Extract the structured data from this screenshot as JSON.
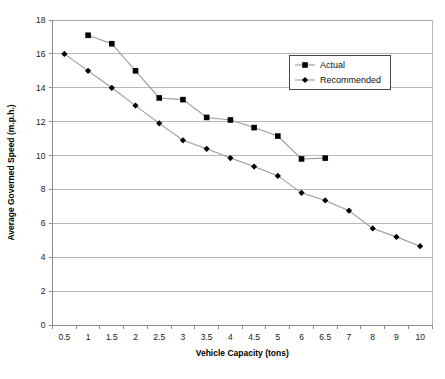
{
  "chart_data": {
    "type": "line",
    "title": "",
    "xlabel": "Vehicle Capacity (tons)",
    "ylabel": "Average Governed Speed (m.p.h.)",
    "categories": [
      "0.5",
      "1",
      "1.5",
      "2",
      "2.5",
      "3",
      "3.5",
      "4",
      "4.5",
      "5",
      "6",
      "6.5",
      "7",
      "8",
      "9",
      "10"
    ],
    "ylim": [
      0,
      18
    ],
    "yticks": [
      "0",
      "2",
      "4",
      "6",
      "8",
      "10",
      "12",
      "14",
      "16",
      "18"
    ],
    "grid": true,
    "legend_position": "top-right",
    "series": [
      {
        "name": "Actual",
        "marker": "square",
        "values": [
          null,
          17.1,
          16.6,
          15.0,
          13.4,
          13.3,
          12.25,
          12.1,
          11.65,
          11.15,
          9.8,
          9.85,
          null,
          null,
          null,
          null
        ]
      },
      {
        "name": "Recommended",
        "marker": "diamond",
        "values": [
          16.0,
          15.0,
          14.0,
          12.95,
          11.9,
          10.9,
          10.4,
          9.85,
          9.35,
          8.8,
          7.8,
          7.35,
          6.75,
          5.7,
          5.2,
          4.65
        ]
      }
    ]
  },
  "legend": {
    "entries": [
      {
        "label": "Actual"
      },
      {
        "label": "Recommended"
      }
    ]
  },
  "axes": {
    "x_title": "Vehicle Capacity (tons)",
    "y_title": "Average Governed Speed (m.p.h.)"
  }
}
